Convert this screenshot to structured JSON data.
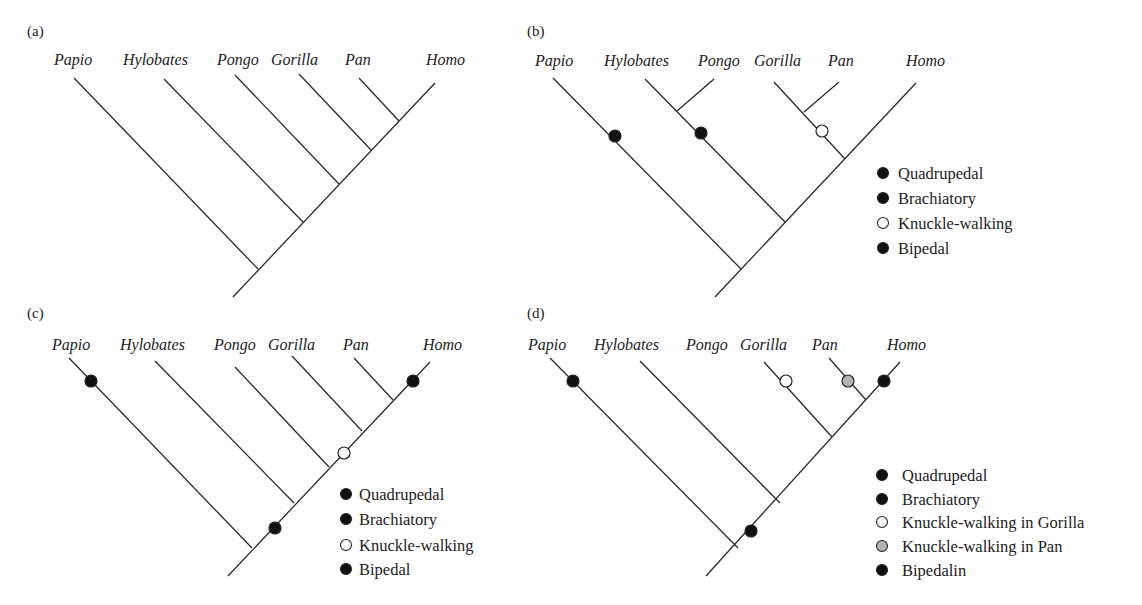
{
  "figure": {
    "background": "#ffffff",
    "line_color": "#2a2a2a",
    "colors": {
      "black": "#111111",
      "white": "#ffffff",
      "gray": "#b3b3b3"
    }
  },
  "panels": [
    {
      "id": "a",
      "label": "(a)",
      "label_pos": [
        27,
        36
      ],
      "taxa": [
        {
          "name": "Papio",
          "x": 54,
          "y": 65
        },
        {
          "name": "Hylobates",
          "x": 123,
          "y": 65
        },
        {
          "name": "Pongo",
          "x": 217,
          "y": 65
        },
        {
          "name": "Gorilla",
          "x": 271,
          "y": 65
        },
        {
          "name": "Pan",
          "x": 345,
          "y": 65
        },
        {
          "name": "Homo",
          "x": 426,
          "y": 65
        }
      ],
      "branches": [
        [
          74,
          78,
          258,
          269
        ],
        [
          164,
          79,
          303,
          222
        ],
        [
          235,
          75,
          339,
          184
        ],
        [
          299,
          74,
          371,
          150
        ],
        [
          359,
          78,
          399,
          121
        ],
        [
          435,
          83,
          233,
          297
        ]
      ],
      "markers": [],
      "legend": null
    },
    {
      "id": "b",
      "label": "(b)",
      "label_pos": [
        527,
        36
      ],
      "taxa": [
        {
          "name": "Papio",
          "x": 535,
          "y": 66
        },
        {
          "name": "Hylobates",
          "x": 604,
          "y": 66
        },
        {
          "name": "Pongo",
          "x": 698,
          "y": 66
        },
        {
          "name": "Gorilla",
          "x": 754,
          "y": 66
        },
        {
          "name": "Pan",
          "x": 828,
          "y": 66
        },
        {
          "name": "Homo",
          "x": 906,
          "y": 66
        }
      ],
      "branches": [
        [
          553,
          78,
          741,
          269
        ],
        [
          645,
          79,
          785,
          222
        ],
        [
          714,
          79,
          677,
          111
        ],
        [
          774,
          82,
          845,
          159
        ],
        [
          839,
          82,
          804,
          112
        ],
        [
          916,
          83,
          715,
          297
        ]
      ],
      "markers": [
        {
          "x": 615,
          "y": 136,
          "fill": "black"
        },
        {
          "x": 701,
          "y": 133,
          "fill": "black"
        },
        {
          "x": 822,
          "y": 131,
          "fill": "white"
        }
      ],
      "legend": {
        "x": 883,
        "text_x": 898,
        "items": [
          {
            "label": "Quadrupedal",
            "y": 173,
            "fill": "black"
          },
          {
            "label": "Brachiatory",
            "y": 198,
            "fill": "black"
          },
          {
            "label": "Knuckle-walking",
            "y": 223,
            "fill": "white"
          },
          {
            "label": "Bipedal",
            "y": 248,
            "fill": "black"
          }
        ]
      }
    },
    {
      "id": "c",
      "label": "(c)",
      "label_pos": [
        27,
        318
      ],
      "taxa": [
        {
          "name": "Papio",
          "x": 52,
          "y": 350
        },
        {
          "name": "Hylobates",
          "x": 120,
          "y": 350
        },
        {
          "name": "Pongo",
          "x": 214,
          "y": 350
        },
        {
          "name": "Gorilla",
          "x": 268,
          "y": 350
        },
        {
          "name": "Pan",
          "x": 343,
          "y": 350
        },
        {
          "name": "Homo",
          "x": 423,
          "y": 350
        }
      ],
      "branches": [
        [
          69,
          358,
          252,
          548
        ],
        [
          155,
          361,
          294,
          503
        ],
        [
          235,
          367,
          329,
          467
        ],
        [
          292,
          356,
          362,
          431
        ],
        [
          354,
          358,
          393,
          400
        ],
        [
          430,
          362,
          228,
          576
        ]
      ],
      "markers": [
        {
          "x": 91,
          "y": 381,
          "fill": "black"
        },
        {
          "x": 413,
          "y": 381,
          "fill": "black"
        },
        {
          "x": 344,
          "y": 453,
          "fill": "white"
        },
        {
          "x": 275,
          "y": 528,
          "fill": "black"
        }
      ],
      "legend": {
        "x": 346,
        "text_x": 359,
        "items": [
          {
            "label": "Quadrupedal",
            "y": 494,
            "fill": "black"
          },
          {
            "label": "Brachiatory",
            "y": 519,
            "fill": "black"
          },
          {
            "label": "Knuckle-walking",
            "y": 545,
            "fill": "white"
          },
          {
            "label": "Bipedal",
            "y": 569,
            "fill": "black"
          }
        ]
      }
    },
    {
      "id": "d",
      "label": "(d)",
      "label_pos": [
        527,
        318
      ],
      "taxa": [
        {
          "name": "Papio",
          "x": 528,
          "y": 350
        },
        {
          "name": "Hylobates",
          "x": 594,
          "y": 350
        },
        {
          "name": "Pongo",
          "x": 686,
          "y": 350
        },
        {
          "name": "Gorilla",
          "x": 740,
          "y": 350
        },
        {
          "name": "Pan",
          "x": 812,
          "y": 350
        },
        {
          "name": "Homo",
          "x": 887,
          "y": 350
        }
      ],
      "branches": [
        [
          550,
          358,
          738,
          548
        ],
        [
          640,
          361,
          780,
          503
        ],
        [
          764,
          362,
          832,
          437
        ],
        [
          829,
          358,
          866,
          400
        ],
        [
          900,
          362,
          706,
          576
        ]
      ],
      "markers": [
        {
          "x": 573,
          "y": 381,
          "fill": "black"
        },
        {
          "x": 786,
          "y": 381,
          "fill": "white"
        },
        {
          "x": 848,
          "y": 381,
          "fill": "gray"
        },
        {
          "x": 884,
          "y": 381,
          "fill": "black"
        },
        {
          "x": 751,
          "y": 531,
          "fill": "black"
        }
      ],
      "legend": {
        "x": 882,
        "text_x": 902,
        "items": [
          {
            "label": "Quadrupedal",
            "y": 475,
            "fill": "black"
          },
          {
            "label": "Brachiatory",
            "y": 499,
            "fill": "black"
          },
          {
            "label": "Knuckle-walking in Gorilla",
            "y": 522,
            "fill": "white"
          },
          {
            "label": "Knuckle-walking in Pan",
            "y": 546,
            "fill": "gray"
          },
          {
            "label": "Bipedalin",
            "y": 570,
            "fill": "black"
          }
        ]
      }
    }
  ]
}
